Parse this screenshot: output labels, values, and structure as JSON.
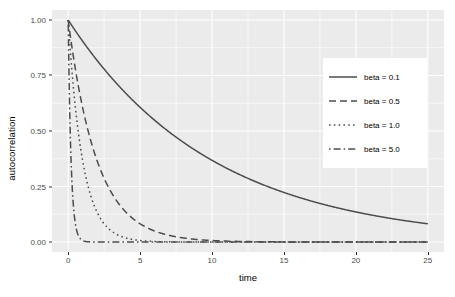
{
  "chart_data": {
    "type": "line",
    "title": "",
    "xlabel": "time",
    "ylabel": "autocorrelation",
    "xlim": [
      0,
      25
    ],
    "ylim": [
      0.0,
      1.0
    ],
    "grid": true,
    "legend_position": "right-inside",
    "x_ticks": [
      "0",
      "5",
      "10",
      "15",
      "20",
      "25"
    ],
    "x_tick_values": [
      0,
      5,
      10,
      15,
      20,
      25
    ],
    "y_ticks": [
      "0.00",
      "0.25",
      "0.50",
      "0.75",
      "1.00"
    ],
    "y_tick_values": [
      0.0,
      0.25,
      0.5,
      0.75,
      1.0
    ],
    "line_color": "#4d4d4d",
    "panel_background": "#ebebeb",
    "gridline_color": "#ffffff",
    "legend_background": "#ffffff",
    "function": "autocorrelation(t) = exp(-beta * t)",
    "series": [
      {
        "name": "beta = 0.1",
        "beta": 0.1,
        "linetype": "solid",
        "dasharray": "",
        "x": [
          0,
          1,
          2,
          3,
          4,
          5,
          6,
          7,
          8,
          9,
          10,
          11,
          12,
          13,
          14,
          15,
          16,
          17,
          18,
          19,
          20,
          21,
          22,
          23,
          24
        ],
        "values": [
          1.0,
          0.905,
          0.819,
          0.741,
          0.67,
          0.607,
          0.549,
          0.497,
          0.449,
          0.407,
          0.368,
          0.333,
          0.301,
          0.273,
          0.247,
          0.223,
          0.202,
          0.183,
          0.165,
          0.15,
          0.135,
          0.122,
          0.111,
          0.1,
          0.091
        ]
      },
      {
        "name": "beta = 0.5",
        "beta": 0.5,
        "linetype": "dashed",
        "dasharray": "7,4",
        "x": [
          0,
          0.5,
          1,
          1.5,
          2,
          2.5,
          3,
          3.5,
          4,
          4.5,
          5,
          6,
          7,
          8,
          9,
          10,
          12,
          14,
          16,
          18,
          20,
          22,
          24
        ],
        "values": [
          1.0,
          0.779,
          0.607,
          0.472,
          0.368,
          0.287,
          0.223,
          0.174,
          0.135,
          0.105,
          0.082,
          0.05,
          0.03,
          0.018,
          0.011,
          0.007,
          0.002,
          0.001,
          0.0,
          0.0,
          0.0,
          0.0,
          0.0
        ]
      },
      {
        "name": "beta = 1.0",
        "beta": 1.0,
        "linetype": "dotted",
        "dasharray": "1.6,3.2",
        "x": [
          0,
          0.25,
          0.5,
          0.75,
          1,
          1.5,
          2,
          2.5,
          3,
          3.5,
          4,
          5,
          6,
          7,
          8,
          10,
          12,
          16,
          20,
          24
        ],
        "values": [
          1.0,
          0.779,
          0.607,
          0.472,
          0.368,
          0.223,
          0.135,
          0.082,
          0.05,
          0.03,
          0.018,
          0.007,
          0.002,
          0.001,
          0.0,
          0.0,
          0.0,
          0.0,
          0.0,
          0.0
        ]
      },
      {
        "name": "beta = 5.0",
        "beta": 5.0,
        "linetype": "dotdash",
        "dasharray": "1.6,3,7,3",
        "x": [
          0,
          0.1,
          0.2,
          0.3,
          0.4,
          0.5,
          0.6,
          0.8,
          1.0,
          1.2,
          1.5,
          2,
          3,
          5,
          10,
          15,
          20,
          24
        ],
        "values": [
          1.0,
          0.607,
          0.368,
          0.223,
          0.135,
          0.082,
          0.05,
          0.018,
          0.007,
          0.002,
          0.001,
          0.0,
          0.0,
          0.0,
          0.0,
          0.0,
          0.0,
          0.0
        ]
      }
    ]
  }
}
